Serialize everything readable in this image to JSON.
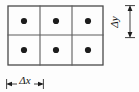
{
  "figure": {
    "background_color": "#fdfdfd",
    "line_color": "#4a4a4a",
    "dot_color": "#1c1c1c",
    "label_color": "#171717"
  },
  "grid": {
    "columns": 3,
    "rows": 2,
    "left": 8,
    "top": 6,
    "right": 103,
    "bottom": 65,
    "vertical_dividers": [
      40,
      72
    ],
    "horizontal_dividers": [
      35
    ],
    "cells": [
      {
        "row": 0,
        "col": 0,
        "dot_cx": 24,
        "dot_cy": 21,
        "dot_r": 3.1
      },
      {
        "row": 0,
        "col": 1,
        "dot_cx": 56,
        "dot_cy": 21,
        "dot_r": 3.1
      },
      {
        "row": 0,
        "col": 2,
        "dot_cx": 88,
        "dot_cy": 21,
        "dot_r": 3.1
      },
      {
        "row": 1,
        "col": 0,
        "dot_cx": 24,
        "dot_cy": 50,
        "dot_r": 3.1
      },
      {
        "row": 1,
        "col": 1,
        "dot_cx": 56,
        "dot_cy": 50,
        "dot_r": 3.1
      },
      {
        "row": 1,
        "col": 2,
        "dot_cx": 88,
        "dot_cy": 50,
        "dot_r": 3.1
      }
    ]
  },
  "annotations": {
    "delta_y": {
      "label": "Δy",
      "orientation": "vertical",
      "rotation_deg": -90,
      "label_x": 118,
      "label_y": 22,
      "dim_line_x": 130,
      "dim_line_top": 6,
      "dim_line_bottom": 37
    },
    "delta_x": {
      "label": "Δx",
      "orientation": "horizontal",
      "rotation_deg": 0,
      "label_x": 25,
      "label_y": 84,
      "dim_line_y": 84,
      "dim_line_left": 7,
      "dim_line_right": 43
    }
  }
}
